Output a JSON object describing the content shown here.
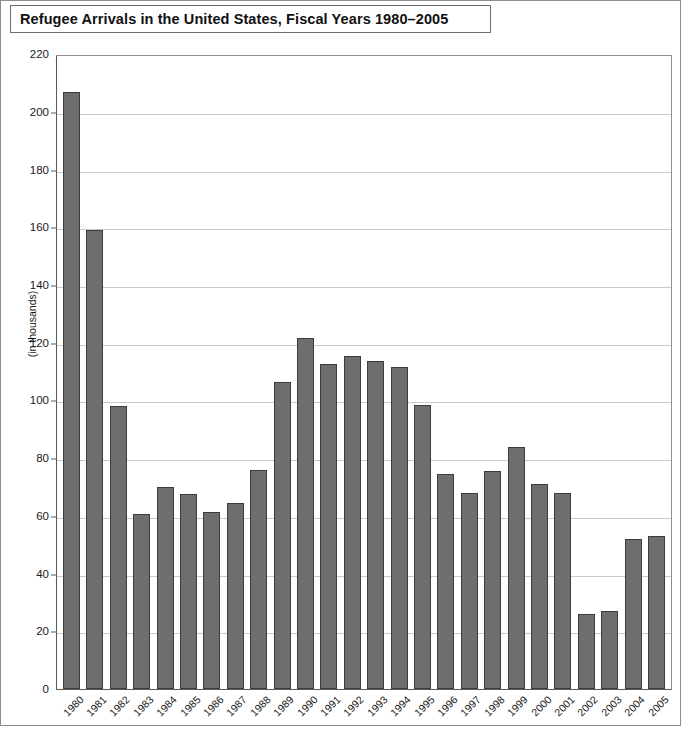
{
  "figure": {
    "title": "Refugee Arrivals in the United States, Fiscal Years 1980–2005",
    "frame_color": "#8d8d8d",
    "bar_color": "#6e6e6e",
    "bar_edge_color": "#3c3c3c",
    "gridline_color": "#c9c9c9",
    "axis_color": "#5a5a5a"
  },
  "chart_data": {
    "type": "bar",
    "title": "Refugee Arrivals in the United States, Fiscal Years 1980–2005",
    "xlabel": "",
    "ylabel": "(in thousands)",
    "ylim": [
      0,
      220
    ],
    "ytick_step": 20,
    "yticks": [
      0,
      20,
      40,
      60,
      80,
      100,
      120,
      140,
      160,
      180,
      200,
      220
    ],
    "ytick_labels": [
      "0",
      "20",
      "40",
      "60",
      "80",
      "100",
      "120",
      "140",
      "160",
      "180",
      "200",
      "220"
    ],
    "grid": true,
    "legend": null,
    "units": "thousands",
    "categories": [
      "1980",
      "1981",
      "1982",
      "1983",
      "1984",
      "1985",
      "1986",
      "1987",
      "1988",
      "1989",
      "1990",
      "1991",
      "1992",
      "1993",
      "1994",
      "1995",
      "1996",
      "1997",
      "1998",
      "1999",
      "2000",
      "2001",
      "2002",
      "2003",
      "2004",
      "2005"
    ],
    "values": [
      207.0,
      159.0,
      98.0,
      60.7,
      70.0,
      67.5,
      61.5,
      64.5,
      76.0,
      106.5,
      121.5,
      112.5,
      115.5,
      113.5,
      111.5,
      98.5,
      74.5,
      68.0,
      75.5,
      84.0,
      71.0,
      68.0,
      26.0,
      27.0,
      52.0,
      53.0
    ]
  }
}
